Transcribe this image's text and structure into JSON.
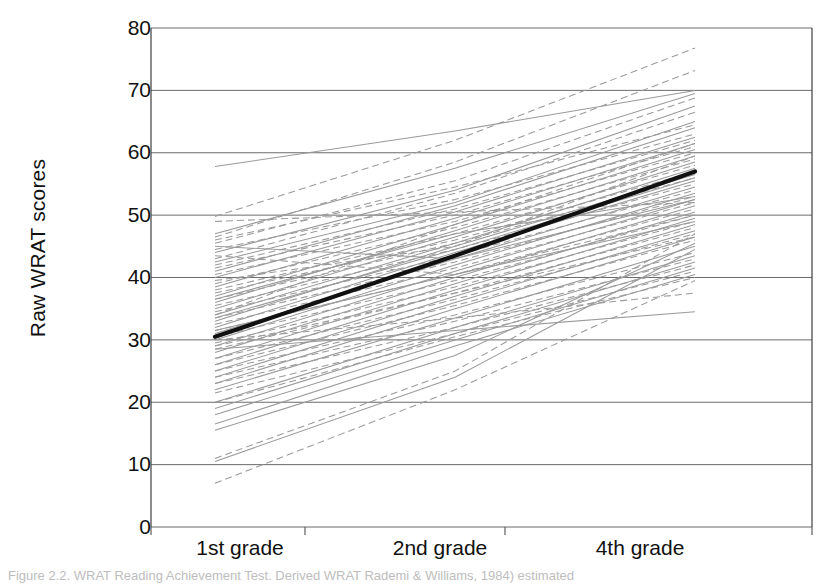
{
  "chart_data": {
    "type": "line",
    "title": "",
    "subtitle": "",
    "xlabel": "",
    "ylabel": "Raw WRAT scores",
    "categories": [
      "1st grade",
      "2nd grade",
      "4th grade"
    ],
    "ylim": [
      0,
      80
    ],
    "ytick_step": 10,
    "yticks": [
      0,
      10,
      20,
      30,
      40,
      50,
      60,
      70,
      80
    ],
    "grid": "horizontal",
    "legend": "none",
    "annotations": [
      "Bold black line is the group mean trajectory",
      "Thin gray solid and dashed lines are individual participant trajectories"
    ],
    "mean_series": {
      "name": "Group mean",
      "style": "solid-bold-black",
      "values": [
        30.5,
        43.5,
        57.0
      ]
    },
    "series": [
      {
        "name": "P01",
        "style": "solid",
        "values": [
          57.8,
          63.5,
          70.0
        ]
      },
      {
        "name": "P02",
        "style": "dashed",
        "values": [
          49.8,
          62.0,
          76.8
        ]
      },
      {
        "name": "P03",
        "style": "dashed",
        "values": [
          46.5,
          58.5,
          73.2
        ]
      },
      {
        "name": "P04",
        "style": "solid",
        "values": [
          47.0,
          57.5,
          69.5
        ]
      },
      {
        "name": "P05",
        "style": "dashed",
        "values": [
          45.5,
          55.5,
          68.8
        ]
      },
      {
        "name": "P06",
        "style": "solid",
        "values": [
          44.0,
          54.0,
          67.5
        ]
      },
      {
        "name": "P07",
        "style": "dashed",
        "values": [
          43.0,
          53.5,
          66.5
        ]
      },
      {
        "name": "P08",
        "style": "solid",
        "values": [
          42.5,
          52.0,
          65.0
        ]
      },
      {
        "name": "P09",
        "style": "dashed",
        "values": [
          46.0,
          54.5,
          64.5
        ]
      },
      {
        "name": "P10",
        "style": "solid",
        "values": [
          41.0,
          51.5,
          64.0
        ]
      },
      {
        "name": "P11",
        "style": "dashed",
        "values": [
          44.5,
          52.5,
          63.0
        ]
      },
      {
        "name": "P12",
        "style": "solid",
        "values": [
          40.0,
          50.5,
          62.5
        ]
      },
      {
        "name": "P13",
        "style": "dashed",
        "values": [
          42.0,
          51.0,
          62.0
        ]
      },
      {
        "name": "P14",
        "style": "solid",
        "values": [
          38.5,
          49.5,
          61.5
        ]
      },
      {
        "name": "P15",
        "style": "dashed",
        "values": [
          41.5,
          50.0,
          61.0
        ]
      },
      {
        "name": "P16",
        "style": "solid",
        "values": [
          37.0,
          48.5,
          60.5
        ]
      },
      {
        "name": "P17",
        "style": "dashed",
        "values": [
          40.5,
          49.0,
          60.0
        ]
      },
      {
        "name": "P18",
        "style": "solid",
        "values": [
          36.0,
          47.5,
          59.5
        ]
      },
      {
        "name": "P19",
        "style": "dashed",
        "values": [
          39.0,
          48.0,
          59.0
        ]
      },
      {
        "name": "P20",
        "style": "solid",
        "values": [
          35.0,
          46.5,
          58.5
        ]
      },
      {
        "name": "P21",
        "style": "dashed",
        "values": [
          38.0,
          47.0,
          58.0
        ]
      },
      {
        "name": "P22",
        "style": "solid",
        "values": [
          34.0,
          45.5,
          57.5
        ]
      },
      {
        "name": "P23",
        "style": "dashed",
        "values": [
          37.5,
          46.0,
          57.0
        ]
      },
      {
        "name": "P24",
        "style": "solid",
        "values": [
          33.0,
          45.0,
          56.5
        ]
      },
      {
        "name": "P25",
        "style": "dashed",
        "values": [
          36.5,
          45.5,
          56.0
        ]
      },
      {
        "name": "P26",
        "style": "solid",
        "values": [
          32.0,
          44.0,
          55.5
        ]
      },
      {
        "name": "P27",
        "style": "dashed",
        "values": [
          35.5,
          44.5,
          55.0
        ]
      },
      {
        "name": "P28",
        "style": "solid",
        "values": [
          31.0,
          43.0,
          54.5
        ]
      },
      {
        "name": "P29",
        "style": "dashed",
        "values": [
          34.5,
          43.5,
          54.0
        ]
      },
      {
        "name": "P30",
        "style": "solid",
        "values": [
          30.0,
          42.0,
          53.5
        ]
      },
      {
        "name": "P31",
        "style": "dashed",
        "values": [
          33.5,
          42.5,
          53.0
        ]
      },
      {
        "name": "P32",
        "style": "solid",
        "values": [
          29.0,
          41.0,
          52.5
        ]
      },
      {
        "name": "P33",
        "style": "dashed",
        "values": [
          32.5,
          41.5,
          52.0
        ]
      },
      {
        "name": "P34",
        "style": "solid",
        "values": [
          28.0,
          40.0,
          51.5
        ]
      },
      {
        "name": "P35",
        "style": "dashed",
        "values": [
          31.5,
          40.5,
          51.0
        ]
      },
      {
        "name": "P36",
        "style": "solid",
        "values": [
          27.0,
          39.0,
          50.5
        ]
      },
      {
        "name": "P37",
        "style": "dashed",
        "values": [
          30.5,
          39.5,
          50.0
        ]
      },
      {
        "name": "P38",
        "style": "solid",
        "values": [
          26.0,
          38.0,
          49.5
        ]
      },
      {
        "name": "P39",
        "style": "dashed",
        "values": [
          29.5,
          38.5,
          49.0
        ]
      },
      {
        "name": "P40",
        "style": "solid",
        "values": [
          25.0,
          37.0,
          48.5
        ]
      },
      {
        "name": "P41",
        "style": "dashed",
        "values": [
          28.5,
          37.5,
          48.0
        ]
      },
      {
        "name": "P42",
        "style": "solid",
        "values": [
          24.0,
          36.0,
          47.5
        ]
      },
      {
        "name": "P43",
        "style": "dashed",
        "values": [
          27.0,
          36.5,
          47.0
        ]
      },
      {
        "name": "P44",
        "style": "solid",
        "values": [
          23.0,
          35.0,
          46.5
        ]
      },
      {
        "name": "P45",
        "style": "dashed",
        "values": [
          26.0,
          35.5,
          46.0
        ]
      },
      {
        "name": "P46",
        "style": "solid",
        "values": [
          22.0,
          33.5,
          45.0
        ]
      },
      {
        "name": "P47",
        "style": "dashed",
        "values": [
          25.0,
          34.0,
          44.0
        ]
      },
      {
        "name": "P48",
        "style": "solid",
        "values": [
          20.0,
          32.0,
          43.5
        ]
      },
      {
        "name": "P49",
        "style": "dashed",
        "values": [
          24.0,
          33.0,
          43.0
        ]
      },
      {
        "name": "P50",
        "style": "solid",
        "values": [
          19.0,
          31.0,
          42.5
        ]
      },
      {
        "name": "P51",
        "style": "dashed",
        "values": [
          23.0,
          32.0,
          42.0
        ]
      },
      {
        "name": "P52",
        "style": "solid",
        "values": [
          18.0,
          30.0,
          41.5
        ]
      },
      {
        "name": "P53",
        "style": "dashed",
        "values": [
          21.5,
          31.0,
          41.0
        ]
      },
      {
        "name": "P54",
        "style": "solid",
        "values": [
          16.5,
          29.0,
          40.5
        ]
      },
      {
        "name": "P55",
        "style": "dashed",
        "values": [
          20.0,
          30.5,
          40.0
        ]
      },
      {
        "name": "P56",
        "style": "solid",
        "values": [
          15.5,
          27.5,
          45.5
        ]
      },
      {
        "name": "P57",
        "style": "dashed",
        "values": [
          11.0,
          25.0,
          47.0
        ]
      },
      {
        "name": "P58",
        "style": "solid",
        "values": [
          10.5,
          24.0,
          44.5
        ]
      },
      {
        "name": "P59",
        "style": "dashed",
        "values": [
          7.0,
          22.0,
          39.5
        ]
      },
      {
        "name": "P60",
        "style": "dashed",
        "values": [
          30.0,
          33.5,
          37.5
        ]
      },
      {
        "name": "P61",
        "style": "solid",
        "values": [
          28.5,
          31.5,
          34.5
        ]
      },
      {
        "name": "P62",
        "style": "dashed",
        "values": [
          49.0,
          50.5,
          52.0
        ]
      },
      {
        "name": "P63",
        "style": "solid",
        "values": [
          45.0,
          43.0,
          52.5
        ]
      },
      {
        "name": "P64",
        "style": "dashed",
        "values": [
          43.5,
          40.5,
          50.0
        ]
      },
      {
        "name": "P65",
        "style": "solid",
        "values": [
          33.5,
          44.5,
          56.0
        ]
      },
      {
        "name": "P66",
        "style": "dashed",
        "values": [
          39.5,
          45.0,
          59.5
        ]
      },
      {
        "name": "P67",
        "style": "solid",
        "values": [
          36.5,
          47.0,
          53.0
        ]
      },
      {
        "name": "P68",
        "style": "dashed",
        "values": [
          34.0,
          48.5,
          61.5
        ]
      },
      {
        "name": "P69",
        "style": "solid",
        "values": [
          31.5,
          40.5,
          49.0
        ]
      },
      {
        "name": "P70",
        "style": "dashed",
        "values": [
          29.0,
          37.5,
          46.5
        ]
      }
    ]
  },
  "axis": {
    "ylabel": "Raw WRAT scores",
    "ytick_labels": [
      "80",
      "70",
      "60",
      "50",
      "40",
      "30",
      "20",
      "10",
      "0"
    ],
    "xtick_labels": [
      "1st grade",
      "2nd grade",
      "4th grade"
    ]
  },
  "caption": {
    "text": "Figure 2.2.  WRAT Reading Achievement Test. Derived WRAT Rademi & Williams, 1984) estimated"
  },
  "colors": {
    "axis": "#4d4d4d",
    "grid": "#6b6b6b",
    "individual_line": "#9a9a9a",
    "mean_line": "#111111",
    "text": "#111111",
    "background": "#ffffff"
  }
}
